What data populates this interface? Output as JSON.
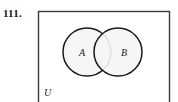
{
  "figure": {
    "problem_number": "111.",
    "type": "venn-diagram",
    "universe_label": "U",
    "sets": [
      {
        "id": "A",
        "label": "A"
      },
      {
        "id": "B",
        "label": "B"
      }
    ],
    "colors": {
      "stroke": "#1a1a1a",
      "circle_fill": "#f5f5f5",
      "rect_fill": "#ffffff",
      "rect_stroke": "#3a3a3a",
      "text": "#1a1a1a",
      "background": "#ffffff"
    },
    "geometry": {
      "rect": {
        "x": 38,
        "y": 11,
        "width": 132,
        "height": 95
      },
      "circle_a": {
        "cx": 87,
        "cy": 52,
        "r": 24
      },
      "circle_b": {
        "cx": 118,
        "cy": 52,
        "r": 24
      },
      "label_a": {
        "x": 82,
        "y": 56
      },
      "label_b": {
        "x": 116,
        "y": 56
      },
      "label_u": {
        "x": 44,
        "y": 95
      }
    }
  }
}
